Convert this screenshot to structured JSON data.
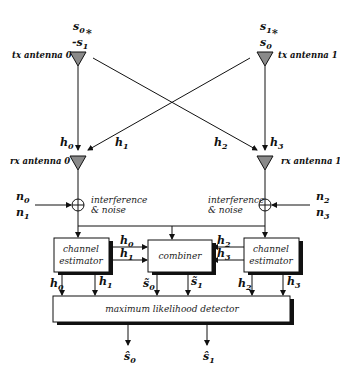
{
  "diagram": {
    "tx": [
      {
        "label": "tx antenna 0",
        "symbols": [
          "s0",
          "-s1*"
        ]
      },
      {
        "label": "tx antenna 1",
        "symbols": [
          "s1",
          "s0*"
        ]
      }
    ],
    "rx": [
      {
        "label": "rx antenna 0",
        "noise": [
          "n0",
          "n1"
        ],
        "noise_label_1": "interference",
        "noise_label_2": "& noise"
      },
      {
        "label": "rx antenna 1",
        "noise": [
          "n2",
          "n3"
        ],
        "noise_label_1": "interference",
        "noise_label_2": "& noise"
      }
    ],
    "channels": [
      "h0",
      "h1",
      "h2",
      "h3"
    ],
    "blocks": {
      "channel_estimator_left_1": "channel",
      "channel_estimator_left_2": "estimator",
      "channel_estimator_right_1": "channel",
      "channel_estimator_right_2": "estimator",
      "combiner": "combiner",
      "detector": "maximum likelihood detector"
    },
    "combiner_outputs": [
      "s̃0",
      "s̃1"
    ],
    "outputs": [
      "ŝ0",
      "ŝ1"
    ],
    "colors": {
      "line": "#111111",
      "antenna_fill": "#8a8a8a",
      "shadow": "#111111"
    }
  }
}
